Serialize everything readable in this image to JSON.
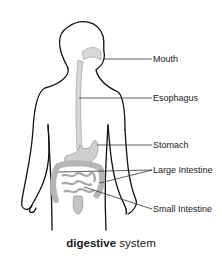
{
  "diagram": {
    "title_bold": "digestive",
    "title_rest": " system",
    "labels": {
      "mouth": "Mouth",
      "esophagus": "Esophagus",
      "stomach": "Stomach",
      "large_intestine": "Large Intestine",
      "small_intestine": "Small Intestine"
    },
    "colors": {
      "outline": "#111111",
      "organ_fill": "#cfcfcf",
      "organ_stroke": "#9a9a9a",
      "leader_line": "#333333"
    }
  }
}
